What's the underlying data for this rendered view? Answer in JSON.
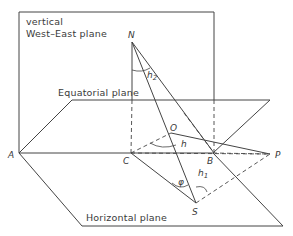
{
  "diagram": {
    "planes": {
      "vertical_line1": "vertical",
      "vertical_line2": "West–East plane",
      "equatorial": "Equatorial plane",
      "horizontal": "Horizontal plane"
    },
    "points": {
      "N": "N",
      "O": "O",
      "A": "A",
      "C": "C",
      "B": "B",
      "P": "P",
      "S": "S"
    },
    "angles": {
      "h2": "h",
      "h2_sub": "2",
      "h": "h",
      "h1": "h",
      "h1_sub": "1",
      "phi": "φ"
    },
    "colors": {
      "line": "#444444",
      "text": "#3a3a3a",
      "background": "#ffffff"
    }
  }
}
